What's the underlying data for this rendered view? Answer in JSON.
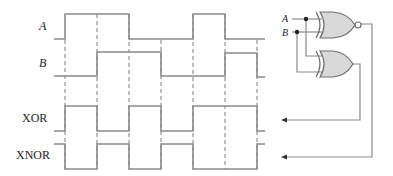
{
  "signals": {
    "a_label": "A",
    "b_label": "B",
    "xor_label": "XOR",
    "xnor_label": "XNOR"
  },
  "circuit": {
    "input_a_label": "A",
    "input_b_label": "B",
    "top_gate": "XNOR",
    "bottom_gate": "XOR"
  },
  "timing": {
    "time_marks_x": [
      65,
      97,
      129,
      161,
      193,
      225,
      257
    ],
    "A": [
      0,
      1,
      1,
      0,
      0,
      1,
      0,
      0
    ],
    "B": [
      0,
      0,
      1,
      1,
      0,
      0,
      1,
      0
    ],
    "XOR": [
      0,
      1,
      0,
      1,
      0,
      1,
      1,
      0
    ],
    "XNOR": [
      1,
      0,
      1,
      0,
      1,
      0,
      0,
      1
    ]
  },
  "colors": {
    "line": "#8a8a8a",
    "gate_fill": "#d9d9d9",
    "text": "#222222"
  }
}
